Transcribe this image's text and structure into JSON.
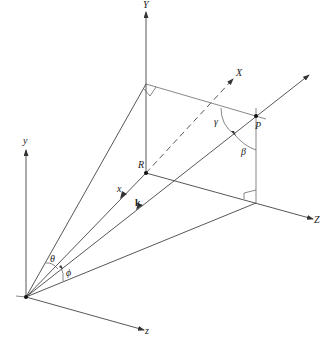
{
  "diagram": {
    "type": "3d-coordinate-geometry",
    "labels": {
      "Y_axis": "Y",
      "X_axis": "X",
      "Z_axis": "Z",
      "y_axis": "y",
      "x_axis": "x",
      "z_axis": "z",
      "point_P": "P",
      "point_R": "R",
      "vector_k": "k",
      "angle_theta": "θ",
      "angle_phi": "ϕ",
      "angle_gamma": "γ",
      "angle_beta": "β"
    },
    "colors": {
      "line": "#444444",
      "background": "#ffffff"
    }
  }
}
